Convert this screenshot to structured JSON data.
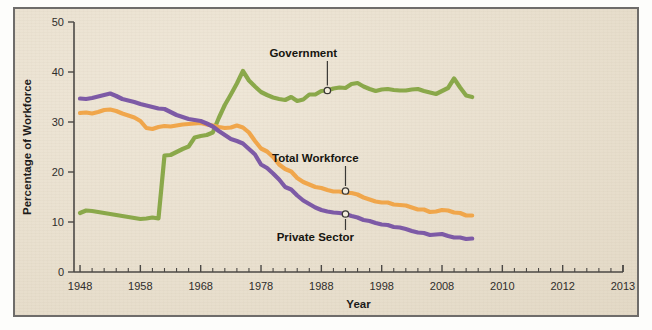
{
  "figure": {
    "background_color": "#ece3d3",
    "frame_color": "#6e6c6a"
  },
  "chart_data": {
    "type": "line",
    "title": "",
    "xlabel": "Year",
    "ylabel": "Percentage of Workforce",
    "xlim": [
      1947,
      2038
    ],
    "ylim": [
      0,
      50
    ],
    "grid": false,
    "legend_position": "inline-annotations",
    "y_ticks": [
      0,
      10,
      20,
      30,
      40,
      50
    ],
    "y_tick_labels": [
      "0",
      "10",
      "20",
      "30",
      "40",
      "50"
    ],
    "x_ticks": [
      1948,
      1958,
      1968,
      1978,
      1988,
      1998,
      2008,
      2018,
      2028,
      2038
    ],
    "x_tick_labels": [
      "1948",
      "1958",
      "1968",
      "1978",
      "1988",
      "1998",
      "2008",
      "2010",
      "2012",
      "2013"
    ],
    "x_minor_tick_step": 2,
    "annotations": [
      {
        "label": "Government",
        "color": "#8aa84a",
        "point_x": 1989,
        "point_y": 36.3,
        "text_x": 1985,
        "text_y": 43.0,
        "text_anchor": "middle",
        "placement": "above"
      },
      {
        "label": "Total Workforce",
        "color": "#f0a64b",
        "point_x": 1992,
        "point_y": 16.2,
        "text_x": 1987,
        "text_y": 22.0,
        "text_anchor": "middle",
        "placement": "above"
      },
      {
        "label": "Private Sector",
        "color": "#7d5aa6",
        "point_x": 1992,
        "point_y": 11.6,
        "text_x": 1987,
        "text_y": 6.2,
        "text_anchor": "middle",
        "placement": "below"
      }
    ],
    "series": [
      {
        "name": "Government",
        "color": "#8aa84a",
        "x": [
          1948,
          1949,
          1950,
          1951,
          1952,
          1953,
          1954,
          1955,
          1956,
          1957,
          1958,
          1959,
          1960,
          1961,
          1962,
          1963,
          1964,
          1965,
          1966,
          1967,
          1968,
          1969,
          1970,
          1971,
          1972,
          1973,
          1974,
          1975,
          1976,
          1977,
          1978,
          1979,
          1980,
          1981,
          1982,
          1983,
          1984,
          1985,
          1986,
          1987,
          1988,
          1989,
          1990,
          1991,
          1992,
          1993,
          1994,
          1995,
          1996,
          1997,
          1998,
          1999,
          2000,
          2001,
          2002,
          2003,
          2004,
          2005,
          2006,
          2007,
          2008,
          2009,
          2010,
          2011,
          2012,
          2013
        ],
        "y": [
          11.8,
          12.3,
          12.2,
          12.0,
          11.8,
          11.6,
          11.4,
          11.2,
          11.0,
          10.8,
          10.6,
          10.7,
          10.9,
          10.7,
          23.3,
          23.4,
          24.0,
          24.6,
          25.1,
          26.9,
          27.2,
          27.4,
          27.9,
          30.8,
          33.4,
          35.5,
          37.7,
          40.2,
          38.3,
          37.1,
          36.0,
          35.4,
          34.9,
          34.6,
          34.4,
          35.0,
          34.2,
          34.5,
          35.5,
          35.5,
          36.2,
          36.3,
          36.7,
          36.9,
          36.8,
          37.6,
          37.8,
          37.1,
          36.6,
          36.2,
          36.5,
          36.6,
          36.4,
          36.3,
          36.3,
          36.5,
          36.6,
          36.2,
          35.9,
          35.6,
          36.2,
          36.8,
          38.7,
          36.9,
          35.3,
          35.0
        ]
      },
      {
        "name": "Total Workforce",
        "color": "#f0a64b",
        "x": [
          1948,
          1949,
          1950,
          1951,
          1952,
          1953,
          1954,
          1955,
          1956,
          1957,
          1958,
          1959,
          1960,
          1961,
          1962,
          1963,
          1964,
          1965,
          1966,
          1967,
          1968,
          1969,
          1970,
          1971,
          1972,
          1973,
          1974,
          1975,
          1976,
          1977,
          1978,
          1979,
          1980,
          1981,
          1982,
          1983,
          1984,
          1985,
          1986,
          1987,
          1988,
          1989,
          1990,
          1991,
          1992,
          1993,
          1994,
          1995,
          1996,
          1997,
          1998,
          1999,
          2000,
          2001,
          2002,
          2003,
          2004,
          2005,
          2006,
          2007,
          2008,
          2009,
          2010,
          2011,
          2012,
          2013
        ],
        "y": [
          31.8,
          31.9,
          31.7,
          32.0,
          32.4,
          32.5,
          32.2,
          31.7,
          31.3,
          30.9,
          30.2,
          28.8,
          28.6,
          29.0,
          29.2,
          29.1,
          29.3,
          29.5,
          29.6,
          29.7,
          29.8,
          29.5,
          29.3,
          29.0,
          28.8,
          28.9,
          29.3,
          28.9,
          27.9,
          26.2,
          24.7,
          24.1,
          23.0,
          21.5,
          20.6,
          20.1,
          18.8,
          18.0,
          17.5,
          17.0,
          16.8,
          16.4,
          16.1,
          16.1,
          15.8,
          15.8,
          15.5,
          14.9,
          14.5,
          14.1,
          13.9,
          13.9,
          13.5,
          13.4,
          13.3,
          12.9,
          12.5,
          12.5,
          12.0,
          12.1,
          12.4,
          12.3,
          11.9,
          11.8,
          11.3,
          11.3
        ]
      },
      {
        "name": "Private Sector",
        "color": "#7d5aa6",
        "x": [
          1948,
          1949,
          1950,
          1951,
          1952,
          1953,
          1954,
          1955,
          1956,
          1957,
          1958,
          1959,
          1960,
          1961,
          1962,
          1963,
          1964,
          1965,
          1966,
          1967,
          1968,
          1969,
          1970,
          1971,
          1972,
          1973,
          1974,
          1975,
          1976,
          1977,
          1978,
          1979,
          1980,
          1981,
          1982,
          1983,
          1984,
          1985,
          1986,
          1987,
          1988,
          1989,
          1990,
          1991,
          1992,
          1993,
          1994,
          1995,
          1996,
          1997,
          1998,
          1999,
          2000,
          2001,
          2002,
          2003,
          2004,
          2005,
          2006,
          2007,
          2008,
          2009,
          2010,
          2011,
          2012,
          2013
        ],
        "y": [
          34.7,
          34.6,
          34.8,
          35.1,
          35.4,
          35.7,
          35.2,
          34.6,
          34.3,
          34.0,
          33.6,
          33.3,
          33.0,
          32.7,
          32.6,
          32.0,
          31.4,
          31.0,
          30.6,
          30.4,
          30.2,
          29.7,
          29.1,
          28.2,
          27.4,
          26.6,
          26.2,
          25.7,
          24.6,
          23.5,
          21.5,
          20.8,
          19.7,
          18.5,
          17.0,
          16.5,
          15.3,
          14.3,
          13.6,
          12.9,
          12.4,
          12.1,
          11.9,
          11.8,
          11.6,
          11.2,
          10.9,
          10.4,
          10.2,
          9.8,
          9.5,
          9.4,
          9.0,
          8.9,
          8.6,
          8.2,
          7.9,
          7.8,
          7.4,
          7.5,
          7.6,
          7.2,
          6.9,
          6.9,
          6.6,
          6.7
        ]
      }
    ]
  }
}
